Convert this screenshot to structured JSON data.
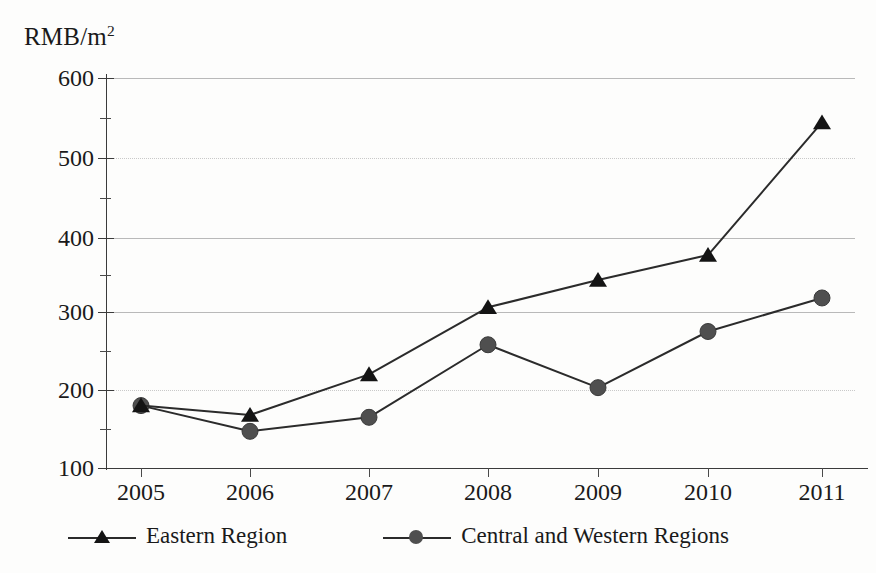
{
  "chart_data": {
    "type": "line",
    "title": "",
    "subtitle": "",
    "xlabel": "",
    "ylabel": "RMB/m",
    "ylabel_sup": "2",
    "unit_caption": "RMB/m²",
    "categories": [
      "2005",
      "2006",
      "2007",
      "2008",
      "2009",
      "2010",
      "2011"
    ],
    "x": [
      2005,
      2006,
      2007,
      2008,
      2009,
      2010,
      2011
    ],
    "series": [
      {
        "name": "Eastern Region",
        "marker": "triangle",
        "color": "#141414",
        "line_color": "#2b2b2b",
        "values": [
          180,
          168,
          220,
          306,
          341,
          373,
          543
        ]
      },
      {
        "name": "Central and Western Regions",
        "marker": "circle",
        "color": "#4f4f4f",
        "line_color": "#2b2b2b",
        "values": [
          180,
          147,
          165,
          258,
          203,
          275,
          318
        ]
      }
    ],
    "ylim": [
      100,
      600
    ],
    "ytick_labels": [
      "100",
      "200",
      "300",
      "400",
      "500",
      "600"
    ],
    "yticks": [
      100,
      200,
      300,
      400,
      500,
      600
    ],
    "yminor_ticks": [
      150,
      250,
      350,
      450,
      550
    ],
    "grid": true,
    "grid_axis": "y",
    "gridline_styles": {
      "600": "solid",
      "500": "dotted",
      "400": "solid",
      "300": "solid",
      "200": "dotted",
      "100": "solid"
    },
    "legend": {
      "position": "bottom",
      "entries": [
        {
          "label": "Eastern Region",
          "marker": "triangle"
        },
        {
          "label": "Central and Western Regions",
          "marker": "circle"
        }
      ]
    }
  },
  "legend": {
    "eastern_label": "Eastern Region",
    "central_western_label": "Central and Western Regions"
  },
  "axis": {
    "y_unit": "RMB/m",
    "y_unit_sup": "2"
  }
}
